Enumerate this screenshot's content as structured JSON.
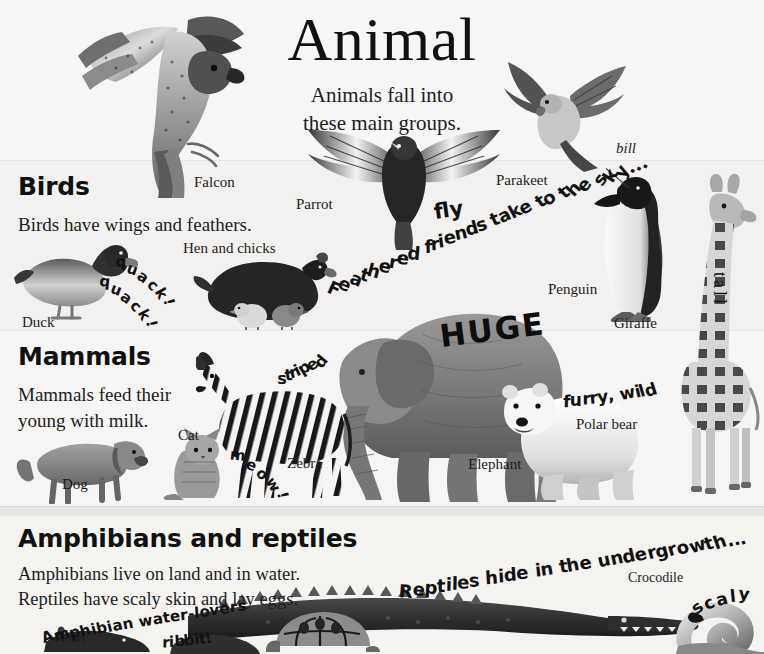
{
  "page": {
    "title": "Animal",
    "subtitle_line1": "Animals fall into",
    "subtitle_line2": "these main groups.",
    "background_color": "#f6f5f3",
    "text_color": "#1a1a1a"
  },
  "sections": {
    "birds": {
      "heading": "Birds",
      "body": "Birds have wings and feathers."
    },
    "mammals": {
      "heading": "Mammals",
      "body_line1": "Mammals feed their",
      "body_line2": "young with milk."
    },
    "amphibians": {
      "heading": "Amphibians and reptiles",
      "body_line1": "Amphibians live on land and in water.",
      "body_line2": "Reptiles have scaly skin and lay eggs."
    }
  },
  "captions": {
    "falcon": "Falcon",
    "parrot": "Parrot",
    "parakeet": "Parakeet",
    "hen_and_chicks": "Hen and chicks",
    "duck": "Duck",
    "penguin": "Penguin",
    "bill": "bill",
    "giraffe": "Giraffe",
    "zebra": "Zebra",
    "cat": "Cat",
    "dog": "Dog",
    "elephant": "Elephant",
    "polar_bear": "Polar bear",
    "newt": "Newt",
    "crocodile": "Crocodile"
  },
  "accent_words": {
    "fly": "fly",
    "quack_1": "quack!",
    "quack_2": "quack!",
    "meow": "meow!",
    "striped": "striped",
    "huge": "HUGE",
    "tall": "tall",
    "furry_wild": "furry, wild",
    "ribbit": "ribbit!",
    "scaly": "scaly"
  },
  "curved_phrases": {
    "feathered": "Feathered friends take to the sky...",
    "reptiles_hide": "Reptiles hide in the undergrowth...",
    "amphibian_water_lovers": "Amphibian water-lovers"
  }
}
